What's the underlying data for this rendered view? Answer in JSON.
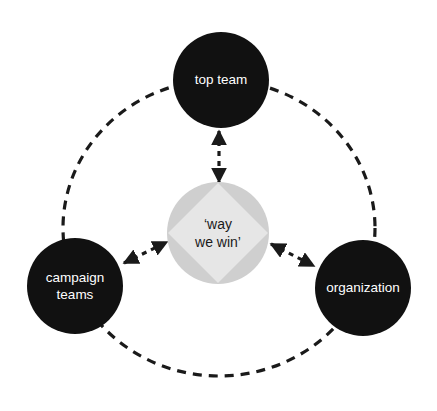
{
  "diagram": {
    "nodes": {
      "top": {
        "lines": [
          "top team"
        ]
      },
      "left": {
        "lines": [
          "campaign",
          "teams"
        ]
      },
      "right": {
        "lines": [
          "organization"
        ]
      },
      "center": {
        "lines": [
          "‘way",
          "we win’"
        ]
      }
    },
    "connections": [
      {
        "from": "top team",
        "to": "way we win",
        "style": "dashed",
        "direction": "bidirectional"
      },
      {
        "from": "campaign teams",
        "to": "way we win",
        "style": "dashed",
        "direction": "bidirectional"
      },
      {
        "from": "organization",
        "to": "way we win",
        "style": "dashed",
        "direction": "bidirectional"
      },
      {
        "from": "top team",
        "to": "campaign teams",
        "style": "dashed",
        "direction": "none"
      },
      {
        "from": "top team",
        "to": "organization",
        "style": "dashed",
        "direction": "none"
      },
      {
        "from": "campaign teams",
        "to": "organization",
        "style": "dashed",
        "direction": "none"
      }
    ],
    "colors": {
      "outer_node": "#111111",
      "outer_text": "#ffffff",
      "center_circle": "#cfcfcf",
      "center_diamond": "#e6e6e6",
      "center_text": "#1a1a1a",
      "lines": "#1a1a1a"
    }
  }
}
